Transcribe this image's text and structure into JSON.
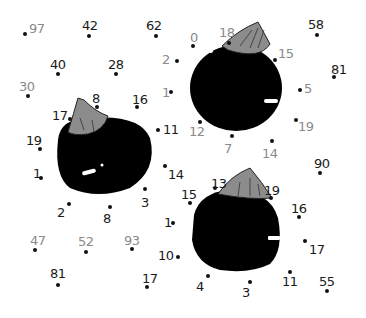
{
  "puzzle": {
    "type": "connect-the-dots",
    "subject": "three eggplants",
    "colors": {
      "eggplant_body": "#000000",
      "stem": "#8c8c8c",
      "highlight": "#ffffff",
      "dark_number": "#1a1a1a",
      "gray_number": "#8a8a8a"
    }
  },
  "points": [
    {
      "label": "97",
      "dx": 25,
      "dy": 34,
      "tx": 29,
      "ty": 22,
      "tone": "gray"
    },
    {
      "label": "42",
      "dx": 89,
      "dy": 36,
      "tx": 82,
      "ty": 19,
      "tone": "dark"
    },
    {
      "label": "62",
      "dx": 156,
      "dy": 36,
      "tx": 146,
      "ty": 19,
      "tone": "dark"
    },
    {
      "label": "40",
      "dx": 58,
      "dy": 74,
      "tx": 50,
      "ty": 58,
      "tone": "dark"
    },
    {
      "label": "28",
      "dx": 116,
      "dy": 74,
      "tx": 108,
      "ty": 58,
      "tone": "dark"
    },
    {
      "label": "30",
      "dx": 28,
      "dy": 96,
      "tx": 19,
      "ty": 80,
      "tone": "gray"
    },
    {
      "label": "8",
      "dx": 97,
      "dy": 107,
      "tx": 92,
      "ty": 92,
      "tone": "dark"
    },
    {
      "label": "16",
      "dx": 137,
      "dy": 107,
      "tx": 132,
      "ty": 93,
      "tone": "dark"
    },
    {
      "label": "17",
      "dx": 70,
      "dy": 119,
      "tx": 52,
      "ty": 109,
      "tone": "dark"
    },
    {
      "label": "19",
      "dx": 40,
      "dy": 149,
      "tx": 26,
      "ty": 134,
      "tone": "dark"
    },
    {
      "label": "11",
      "dx": 158,
      "dy": 130,
      "tx": 163,
      "ty": 123,
      "tone": "dark"
    },
    {
      "label": "1",
      "dx": 41,
      "dy": 178,
      "tx": 33,
      "ty": 167,
      "tone": "dark"
    },
    {
      "label": "14",
      "dx": 165,
      "dy": 166,
      "tx": 168,
      "ty": 168,
      "tone": "dark"
    },
    {
      "label": "3",
      "dx": 145,
      "dy": 189,
      "tx": 141,
      "ty": 196,
      "tone": "dark"
    },
    {
      "label": "2",
      "dx": 69,
      "dy": 204,
      "tx": 57,
      "ty": 206,
      "tone": "dark"
    },
    {
      "label": "8",
      "dx": 110,
      "dy": 207,
      "tx": 103,
      "ty": 212,
      "tone": "dark"
    },
    {
      "label": "1",
      "dx": 173,
      "dy": 223,
      "tx": 164,
      "ty": 216,
      "tone": "dark"
    },
    {
      "label": "15",
      "dx": 190,
      "dy": 203,
      "tx": 181,
      "ty": 188,
      "tone": "dark"
    },
    {
      "label": "47",
      "dx": 35,
      "dy": 250,
      "tx": 30,
      "ty": 234,
      "tone": "gray"
    },
    {
      "label": "52",
      "dx": 86,
      "dy": 252,
      "tx": 78,
      "ty": 235,
      "tone": "gray"
    },
    {
      "label": "93",
      "dx": 132,
      "dy": 249,
      "tx": 124,
      "ty": 234,
      "tone": "gray"
    },
    {
      "label": "10",
      "dx": 178,
      "dy": 257,
      "tx": 158,
      "ty": 249,
      "tone": "dark"
    },
    {
      "label": "81",
      "dx": 58,
      "dy": 285,
      "tx": 50,
      "ty": 267,
      "tone": "dark"
    },
    {
      "label": "17",
      "dx": 147,
      "dy": 287,
      "tx": 142,
      "ty": 272,
      "tone": "dark"
    },
    {
      "label": "0",
      "dx": 193,
      "dy": 46,
      "tx": 190,
      "ty": 31,
      "tone": "gray"
    },
    {
      "label": "18",
      "dx": 229,
      "dy": 43,
      "tx": 219,
      "ty": 26,
      "tone": "gray"
    },
    {
      "label": "2",
      "dx": 177,
      "dy": 61,
      "tx": 162,
      "ty": 53,
      "tone": "gray"
    },
    {
      "label": "15",
      "dx": 275,
      "dy": 60,
      "tx": 278,
      "ty": 47,
      "tone": "gray"
    },
    {
      "label": "58",
      "dx": 317,
      "dy": 35,
      "tx": 308,
      "ty": 18,
      "tone": "dark"
    },
    {
      "label": "81",
      "dx": 334,
      "dy": 77,
      "tx": 331,
      "ty": 63,
      "tone": "dark"
    },
    {
      "label": "1",
      "dx": 171,
      "dy": 92,
      "tx": 162,
      "ty": 86,
      "tone": "gray"
    },
    {
      "label": "5",
      "dx": 300,
      "dy": 90,
      "tx": 304,
      "ty": 82,
      "tone": "gray"
    },
    {
      "label": "12",
      "dx": 200,
      "dy": 122,
      "tx": 189,
      "ty": 125,
      "tone": "gray"
    },
    {
      "label": "19",
      "dx": 296,
      "dy": 120,
      "tx": 298,
      "ty": 120,
      "tone": "gray"
    },
    {
      "label": "7",
      "dx": 232,
      "dy": 136,
      "tx": 224,
      "ty": 142,
      "tone": "gray"
    },
    {
      "label": "14",
      "dx": 272,
      "dy": 141,
      "tx": 262,
      "ty": 147,
      "tone": "gray"
    },
    {
      "label": "90",
      "dx": 320,
      "dy": 173,
      "tx": 314,
      "ty": 157,
      "tone": "dark"
    },
    {
      "label": "13",
      "dx": 215,
      "dy": 188,
      "tx": 211,
      "ty": 177,
      "tone": "dark"
    },
    {
      "label": "19",
      "dx": 271,
      "dy": 198,
      "tx": 264,
      "ty": 184,
      "tone": "dark"
    },
    {
      "label": "16",
      "dx": 299,
      "dy": 217,
      "tx": 291,
      "ty": 202,
      "tone": "dark"
    },
    {
      "label": "17",
      "dx": 305,
      "dy": 241,
      "tx": 309,
      "ty": 243,
      "tone": "dark"
    },
    {
      "label": "4",
      "dx": 208,
      "dy": 276,
      "tx": 196,
      "ty": 280,
      "tone": "dark"
    },
    {
      "label": "3",
      "dx": 250,
      "dy": 282,
      "tx": 242,
      "ty": 286,
      "tone": "dark"
    },
    {
      "label": "11",
      "dx": 290,
      "dy": 272,
      "tx": 282,
      "ty": 275,
      "tone": "dark"
    },
    {
      "label": "55",
      "dx": 327,
      "dy": 291,
      "tx": 319,
      "ty": 275,
      "tone": "dark"
    }
  ]
}
